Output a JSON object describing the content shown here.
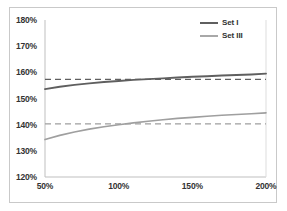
{
  "chart_data": {
    "type": "line",
    "title": "",
    "xlabel": "",
    "ylabel": "",
    "xlim": [
      50,
      200
    ],
    "ylim": [
      120,
      180
    ],
    "grid": false,
    "legend_position": "top-right",
    "x_ticks": [
      "50%",
      "100%",
      "150%",
      "200%"
    ],
    "x_tick_values": [
      50,
      100,
      150,
      200
    ],
    "y_ticks": [
      "120%",
      "130%",
      "140%",
      "150%",
      "160%",
      "170%",
      "180%"
    ],
    "y_tick_values": [
      120,
      130,
      140,
      150,
      160,
      170,
      180
    ],
    "x": [
      50,
      60,
      70,
      80,
      90,
      100,
      110,
      120,
      130,
      140,
      150,
      160,
      170,
      180,
      190,
      200
    ],
    "series": [
      {
        "name": "Set I",
        "style": "solid",
        "color": "#5f5f5f",
        "values": [
          153.6,
          154.5,
          155.2,
          155.8,
          156.3,
          156.7,
          157.1,
          157.4,
          157.7,
          158.0,
          158.3,
          158.5,
          158.8,
          159.0,
          159.2,
          159.5
        ]
      },
      {
        "name": "Set I reference",
        "style": "dashed",
        "color": "#5f5f5f",
        "constant": 157.3,
        "values": [
          157.3,
          157.3,
          157.3,
          157.3,
          157.3,
          157.3,
          157.3,
          157.3,
          157.3,
          157.3,
          157.3,
          157.3,
          157.3,
          157.3,
          157.3,
          157.3
        ]
      },
      {
        "name": "Set III",
        "style": "solid",
        "color": "#9f9f9f",
        "values": [
          134.3,
          135.9,
          137.2,
          138.3,
          139.2,
          140.0,
          140.7,
          141.3,
          141.9,
          142.4,
          142.8,
          143.2,
          143.6,
          143.9,
          144.2,
          144.5
        ]
      },
      {
        "name": "Set III reference",
        "style": "dashed",
        "color": "#9f9f9f",
        "constant": 140.3,
        "values": [
          140.3,
          140.3,
          140.3,
          140.3,
          140.3,
          140.3,
          140.3,
          140.3,
          140.3,
          140.3,
          140.3,
          140.3,
          140.3,
          140.3,
          140.3,
          140.3
        ]
      }
    ],
    "legend": [
      {
        "label": "Set I",
        "color": "#5f5f5f"
      },
      {
        "label": "Set III",
        "color": "#9f9f9f"
      }
    ]
  },
  "colors": {
    "set_1": "#5f5f5f",
    "set_3": "#9f9f9f",
    "axis": "#bfbfbf",
    "frame": "#c9c9c9",
    "text": "#333333",
    "background": "#ffffff"
  }
}
